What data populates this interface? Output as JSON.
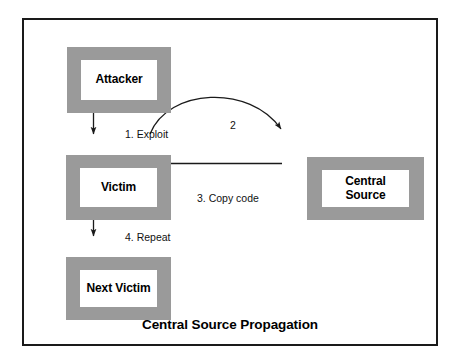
{
  "diagram": {
    "title": "Central Source Propagation",
    "frame_color": "#1a1a1a",
    "node_border_color": "#9a9a9a",
    "background": "#ffffff",
    "nodes": [
      {
        "id": "attacker",
        "label": "Attacker"
      },
      {
        "id": "victim",
        "label": "Victim"
      },
      {
        "id": "next_victim",
        "label": "Next Victim"
      },
      {
        "id": "central_source",
        "label": "Central\nSource"
      }
    ],
    "edges": [
      {
        "id": "exploit",
        "label": "1. Exploit",
        "from": "attacker",
        "to": "victim",
        "shape": "straight-down"
      },
      {
        "id": "two",
        "label": "2",
        "from": "victim",
        "to": "central_source",
        "shape": "curved-arc"
      },
      {
        "id": "copy_code",
        "label": "3. Copy code",
        "from": "central_source",
        "to": "victim",
        "shape": "straight-left"
      },
      {
        "id": "repeat",
        "label": "4. Repeat",
        "from": "victim",
        "to": "next_victim",
        "shape": "straight-down"
      }
    ]
  }
}
